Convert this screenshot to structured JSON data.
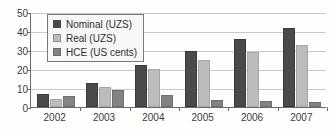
{
  "chart_data": {
    "type": "bar",
    "title": "",
    "subtitle": "",
    "xlabel": "",
    "ylabel": "",
    "categories": [
      "2002",
      "2003",
      "2004",
      "2005",
      "2006",
      "2007"
    ],
    "series": [
      {
        "name": "Nominal (UZS)",
        "color": "#4a4a4a",
        "values": [
          7.0,
          12.5,
          22.0,
          29.5,
          36.0,
          41.5
        ]
      },
      {
        "name": "Real (UZS)",
        "color": "#bcbcbc",
        "values": [
          4.0,
          10.5,
          20.0,
          24.5,
          29.0,
          32.5
        ]
      },
      {
        "name": "HCE (US cents)",
        "color": "#838383",
        "values": [
          6.0,
          9.0,
          6.5,
          3.5,
          3.0,
          2.5
        ]
      }
    ],
    "ylim": [
      0,
      50
    ],
    "yticks": [
      0,
      10,
      20,
      30,
      40,
      50
    ],
    "ytick_labels": [
      "0",
      "10",
      "20",
      "30",
      "40",
      "50"
    ],
    "grid": true,
    "legend_position": "top-left"
  },
  "axis": {
    "y_tick_labels": [
      "50",
      "40",
      "30",
      "20",
      "10",
      "0"
    ],
    "x_tick_labels": [
      "2002",
      "2003",
      "2004",
      "2005",
      "2006",
      "2007"
    ]
  },
  "legend": {
    "entries": [
      {
        "label": "Nominal (UZS)"
      },
      {
        "label": "Real (UZS)"
      },
      {
        "label": "HCE (US cents)"
      }
    ]
  }
}
